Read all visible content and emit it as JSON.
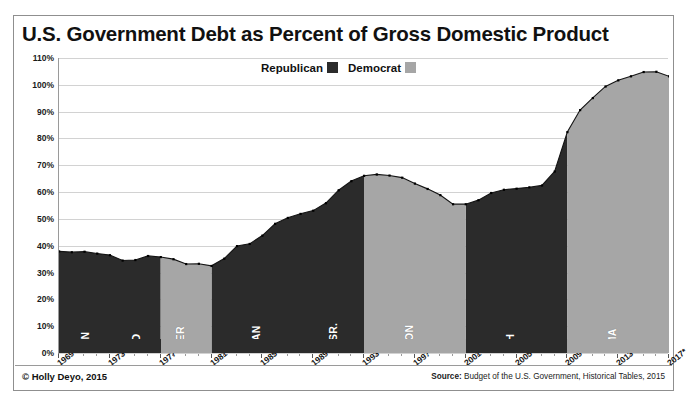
{
  "chart_data": {
    "type": "area",
    "title": "U.S. Government Debt as Percent of Gross Domestic Product",
    "xlabel": "",
    "ylabel": "",
    "ylim": [
      0,
      110
    ],
    "xlim": [
      1969,
      2017
    ],
    "grid": true,
    "ytick_labels": [
      "110%",
      "100%",
      "90%",
      "80%",
      "70%",
      "60%",
      "50%",
      "40%",
      "30%",
      "20%",
      "10%",
      "0%"
    ],
    "ytick_values": [
      110,
      100,
      90,
      80,
      70,
      60,
      50,
      40,
      30,
      20,
      10,
      0
    ],
    "xtick_labels": [
      "1969",
      "1973",
      "1977",
      "1981",
      "1985",
      "1989",
      "1993",
      "1997",
      "2001",
      "2005",
      "2009",
      "2013",
      "2017*"
    ],
    "xtick_values": [
      1969,
      1973,
      1977,
      1981,
      1985,
      1989,
      1993,
      1997,
      2001,
      2005,
      2009,
      2013,
      2017
    ],
    "legend": {
      "position": "top-center",
      "entries": [
        {
          "name": "Republican",
          "color": "#2b2b2b"
        },
        {
          "name": "Democrat",
          "color": "#a6a6a6"
        }
      ]
    },
    "x": [
      1969,
      1970,
      1971,
      1972,
      1973,
      1974,
      1975,
      1976,
      1977,
      1978,
      1979,
      1980,
      1981,
      1982,
      1983,
      1984,
      1985,
      1986,
      1987,
      1988,
      1989,
      1990,
      1991,
      1992,
      1993,
      1994,
      1995,
      1996,
      1997,
      1998,
      1999,
      2000,
      2001,
      2002,
      2003,
      2004,
      2005,
      2006,
      2007,
      2008,
      2009,
      2010,
      2011,
      2012,
      2013,
      2014,
      2015,
      2016,
      2017
    ],
    "y": [
      37.9,
      37.6,
      37.8,
      37.1,
      36.5,
      34.5,
      34.7,
      36.2,
      35.8,
      35.0,
      33.2,
      33.3,
      32.5,
      35.2,
      39.9,
      40.7,
      43.8,
      48.2,
      50.4,
      51.9,
      53.1,
      55.9,
      60.7,
      64.1,
      66.1,
      66.6,
      66.2,
      65.4,
      63.2,
      61.2,
      58.9,
      55.5,
      55.5,
      57.0,
      59.7,
      60.9,
      61.3,
      61.8,
      62.5,
      67.7,
      82.4,
      90.6,
      95.1,
      99.4,
      101.7,
      103.2,
      104.8,
      104.9,
      103.2
    ],
    "series": [
      {
        "name": "Republican",
        "color": "#2b2b2b",
        "ranges": [
          [
            1969,
            1977
          ],
          [
            1981,
            1993
          ],
          [
            2001,
            2009
          ]
        ]
      },
      {
        "name": "Democrat",
        "color": "#a6a6a6",
        "ranges": [
          [
            1977,
            1981
          ],
          [
            1993,
            2001
          ],
          [
            2009,
            2017
          ]
        ]
      }
    ],
    "presidents": [
      {
        "name": "NIXON",
        "party": "Republican",
        "start": 1969,
        "end": 1974,
        "color": "#2b2b2b"
      },
      {
        "name": "FORD",
        "party": "Republican",
        "start": 1974,
        "end": 1977,
        "color": "#2b2b2b"
      },
      {
        "name": "CARTER",
        "party": "Democrat",
        "start": 1977,
        "end": 1981,
        "color": "#a6a6a6"
      },
      {
        "name": "REAGAN",
        "party": "Republican",
        "start": 1981,
        "end": 1989,
        "color": "#2b2b2b"
      },
      {
        "name": "BUSH SR.",
        "party": "Republican",
        "start": 1989,
        "end": 1993,
        "color": "#2b2b2b"
      },
      {
        "name": "CLINTON",
        "party": "Democrat",
        "start": 1993,
        "end": 2001,
        "color": "#a6a6a6"
      },
      {
        "name": "BUSH",
        "party": "Republican",
        "start": 2001,
        "end": 2009,
        "color": "#2b2b2b"
      },
      {
        "name": "OBAMA",
        "party": "Democrat",
        "start": 2009,
        "end": 2017,
        "color": "#a6a6a6"
      }
    ]
  },
  "footer": {
    "copyright": "© Holly Deyo, 2015",
    "source_label": "Source:",
    "source_text": "Budget of the U.S. Government, Historical Tables,  2015"
  }
}
